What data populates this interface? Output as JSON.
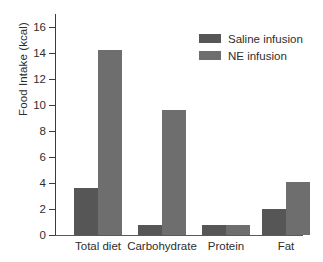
{
  "chart_data": {
    "type": "bar",
    "title": "",
    "xlabel": "",
    "ylabel": "Food Intake (kcal)",
    "categories": [
      "Total diet",
      "Carbohydrate",
      "Protein",
      "Fat"
    ],
    "series": [
      {
        "name": "Saline infusion",
        "color": "#565656",
        "values": [
          3.6,
          0.8,
          0.8,
          2.0
        ]
      },
      {
        "name": "NE infusion",
        "color": "#6e6e6e",
        "values": [
          14.2,
          9.6,
          0.75,
          4.1
        ]
      }
    ],
    "ylim": [
      0,
      17
    ],
    "yticks": [
      0,
      2,
      4,
      6,
      8,
      10,
      12,
      14,
      16
    ],
    "ytick_labels": [
      "0",
      "2",
      "4",
      "6",
      "8",
      "10",
      "12",
      "14",
      "16"
    ],
    "grid": false,
    "legend_position": "top-right",
    "legend": [
      {
        "label": "Saline infusion",
        "color": "#565656"
      },
      {
        "label": "NE infusion",
        "color": "#6e6e6e"
      }
    ]
  }
}
